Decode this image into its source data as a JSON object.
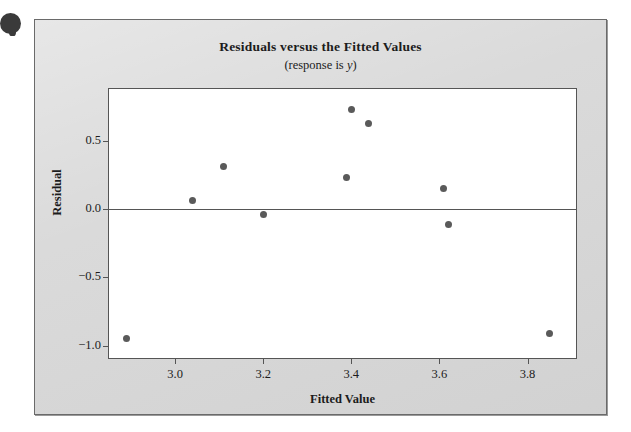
{
  "figure": {
    "bullet_icon": "bullet-blob-icon",
    "panel_background": "#d6d6d6",
    "plot_background": "#ffffff",
    "frame_color": "#555555",
    "marker_color": "#5a5a5a"
  },
  "chart_data": {
    "type": "scatter",
    "title": "Residuals versus the Fitted Values",
    "subtitle": "(response is y)",
    "subtitle_prefix": "(response is ",
    "subtitle_variable": "y",
    "subtitle_suffix": ")",
    "xlabel": "Fitted Value",
    "ylabel": "Residual",
    "xlim": [
      2.85,
      3.91
    ],
    "ylim": [
      -1.09,
      0.88
    ],
    "xticks": [
      3.0,
      3.2,
      3.4,
      3.6,
      3.8
    ],
    "xtick_labels": [
      "3.0",
      "3.2",
      "3.4",
      "3.6",
      "3.8"
    ],
    "yticks": [
      0.5,
      0.0,
      -0.5,
      -1.0
    ],
    "ytick_labels": [
      "0.5",
      "0.0",
      "−0.5",
      "−1.0"
    ],
    "grid": false,
    "legend": null,
    "reference_line": {
      "orientation": "horizontal",
      "y": 0.0,
      "color": "#555555"
    },
    "points": [
      {
        "x": 2.89,
        "y": -0.95
      },
      {
        "x": 3.04,
        "y": 0.06
      },
      {
        "x": 3.11,
        "y": 0.31
      },
      {
        "x": 3.2,
        "y": -0.04
      },
      {
        "x": 3.39,
        "y": 0.23
      },
      {
        "x": 3.4,
        "y": 0.73
      },
      {
        "x": 3.44,
        "y": 0.63
      },
      {
        "x": 3.61,
        "y": 0.15
      },
      {
        "x": 3.62,
        "y": -0.11
      },
      {
        "x": 3.85,
        "y": -0.91
      }
    ]
  }
}
